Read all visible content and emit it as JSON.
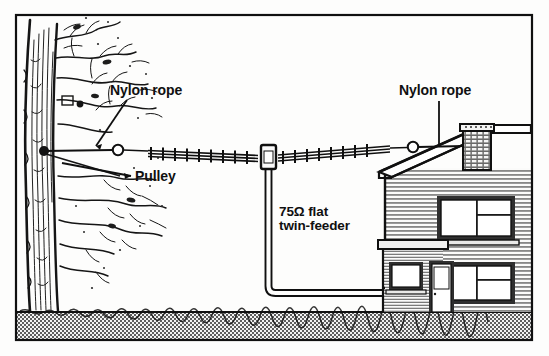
{
  "figure": {
    "kind": "technical-line-drawing",
    "background_color": "#fdfdfc",
    "ink_color": "#101010",
    "frame": {
      "border_color": "#101010",
      "border_width_px": 2
    },
    "ground": {
      "label": "ground",
      "fill_color": "#a8a8a8",
      "pattern": "stipple"
    }
  },
  "labels": {
    "nylon_rope_left": "Nylon rope",
    "nylon_rope_right": "Nylon rope",
    "pulley": "Pulley",
    "feeder_line1": "75Ω flat",
    "feeder_line2": "twin-feeder"
  },
  "components": {
    "tree": "tree",
    "pulley_ring": "pulley",
    "antenna_left_element": "antenna-element",
    "antenna_right_element": "antenna-element",
    "centre_insulator": "centre-insulator",
    "feeder": "twin-feeder-cable",
    "drip_loop": "drip-loop",
    "end_insulator_ring": "end-insulator",
    "house": "house",
    "chimney": "chimney",
    "roof": "roof",
    "extension": "single-storey-extension",
    "door": "front-door",
    "windows_count": 4
  },
  "geometry": {
    "canvas": {
      "width": 549,
      "height": 356
    },
    "frame_rect": {
      "x": 15,
      "y": 14,
      "width": 518,
      "height": 327
    },
    "ground_top_y": 312,
    "rope_y": 150,
    "tree_anchor": {
      "x": 44,
      "y": 151
    },
    "pulley": {
      "x": 118,
      "y": 150,
      "r": 5
    },
    "antenna_left_start": {
      "x": 148,
      "y": 152
    },
    "centre_insulator": {
      "x": 268,
      "y": 157
    },
    "antenna_right_end": {
      "x": 390,
      "y": 148
    },
    "end_ring": {
      "x": 413,
      "y": 147,
      "r": 5
    },
    "chimney_anchor": {
      "x": 470,
      "y": 146
    },
    "feeder_x": 268,
    "feeder_bottom_y": 296,
    "feeder_entry": {
      "x": 383,
      "y": 288
    }
  }
}
